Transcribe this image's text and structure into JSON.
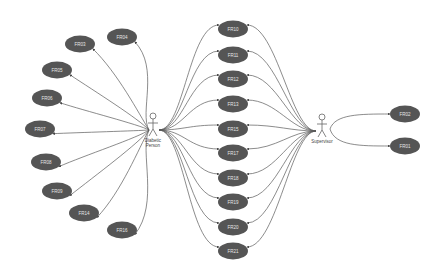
{
  "actors": [
    {
      "id": "diabetic",
      "name_line1": "Diabetic",
      "name_line2": "Person",
      "x": 153,
      "y": 128
    },
    {
      "id": "supervisor",
      "name_line1": "Supervisor",
      "name_line2": "",
      "x": 322,
      "y": 129
    }
  ],
  "use_cases": {
    "left": [
      {
        "id": "FR03",
        "label": "FR03",
        "x": 80,
        "y": 44
      },
      {
        "id": "FR04",
        "label": "FR04",
        "x": 122,
        "y": 37
      },
      {
        "id": "FR05",
        "label": "FR05",
        "x": 57,
        "y": 70
      },
      {
        "id": "FR06",
        "label": "FR06",
        "x": 47,
        "y": 98
      },
      {
        "id": "FR07",
        "label": "FR07",
        "x": 40,
        "y": 129
      },
      {
        "id": "FR08",
        "label": "FR08",
        "x": 46,
        "y": 162
      },
      {
        "id": "FR09",
        "label": "FR09",
        "x": 57,
        "y": 191
      },
      {
        "id": "FR14",
        "label": "FR14",
        "x": 84,
        "y": 213
      },
      {
        "id": "FR16",
        "label": "FR16",
        "x": 122,
        "y": 230
      }
    ],
    "center": [
      {
        "id": "FR10",
        "label": "FR10",
        "x": 233,
        "y": 29
      },
      {
        "id": "FR11",
        "label": "FR11",
        "x": 233,
        "y": 55
      },
      {
        "id": "FR12",
        "label": "FR12",
        "x": 233,
        "y": 79
      },
      {
        "id": "FR13",
        "label": "FR13",
        "x": 233,
        "y": 104
      },
      {
        "id": "FR15",
        "label": "FR15",
        "x": 233,
        "y": 129
      },
      {
        "id": "FR17",
        "label": "FR17",
        "x": 233,
        "y": 153
      },
      {
        "id": "FR18",
        "label": "FR18",
        "x": 233,
        "y": 178
      },
      {
        "id": "FR19",
        "label": "FR19",
        "x": 233,
        "y": 202
      },
      {
        "id": "FR20",
        "label": "FR20",
        "x": 233,
        "y": 227
      },
      {
        "id": "FR21",
        "label": "FR21",
        "x": 233,
        "y": 251
      }
    ],
    "right": [
      {
        "id": "FR02",
        "label": "FR02",
        "x": 405,
        "y": 114
      },
      {
        "id": "FR01",
        "label": "FR01",
        "x": 405,
        "y": 146
      }
    ]
  },
  "colors": {
    "use_case_fill": "#555555",
    "use_case_text": "#e6e6e6",
    "edge": "#5a5a5a",
    "actor": "#666666",
    "background": "#ffffff"
  }
}
